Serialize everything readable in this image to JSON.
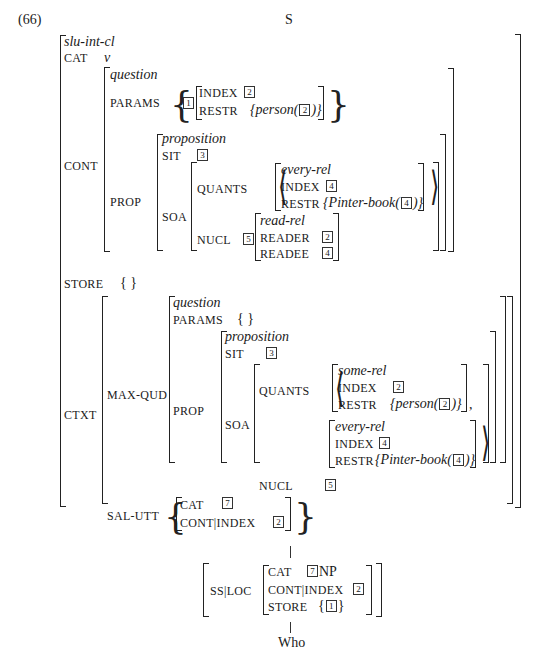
{
  "example_number": "(66)",
  "root_label": "S",
  "avm": {
    "type": "slu-int-cl",
    "cat_attr": "CAT",
    "cat_val": "v",
    "cont_attr": "CONT",
    "cont": {
      "type": "question",
      "params_attr": "PARAMS",
      "params_tag": "1",
      "params_index_attr": "INDEX",
      "params_index_tag": "2",
      "params_restr_attr": "RESTR",
      "params_restr_val": "person(",
      "params_restr_tag": "2",
      "prop_attr": "PROP",
      "prop": {
        "type": "proposition",
        "sit_attr": "SIT",
        "sit_tag": "3",
        "soa_attr": "SOA",
        "quants_attr": "QUANTS",
        "quant": {
          "type": "every-rel",
          "index_attr": "INDEX",
          "index_tag": "4",
          "restr_attr": "RESTR",
          "restr_val": "Pinter-book(",
          "restr_tag": "4"
        },
        "nucl_attr": "NUCL",
        "nucl_tag": "5",
        "nucl": {
          "type": "read-rel",
          "reader_attr": "READER",
          "reader_tag": "2",
          "readee_attr": "READEE",
          "readee_tag": "4"
        }
      }
    },
    "store_attr": "STORE",
    "store_val": "{ }",
    "ctxt_attr": "CTXT",
    "ctxt": {
      "maxqud_attr": "MAX-QUD",
      "maxqud": {
        "type": "question",
        "params_attr": "PARAMS",
        "params_val": "{ }",
        "prop_attr": "PROP",
        "prop": {
          "type": "proposition",
          "sit_attr": "SIT",
          "sit_tag": "3",
          "soa_attr": "SOA",
          "quants_attr": "QUANTS",
          "quant1": {
            "type": "some-rel",
            "index_attr": "INDEX",
            "index_tag": "2",
            "restr_attr": "RESTR",
            "restr_val": "person(",
            "restr_tag": "2"
          },
          "quant2": {
            "type": "every-rel",
            "index_attr": "INDEX",
            "index_tag": "4",
            "restr_attr": "RESTR",
            "restr_val": "Pinter-book(",
            "restr_tag": "4"
          },
          "nucl_attr": "NUCL",
          "nucl_tag": "5"
        }
      },
      "salutt_attr": "SAL-UTT",
      "salutt": {
        "cat_attr": "CAT",
        "cat_tag": "7",
        "cont_attr": "CONT|INDEX",
        "cont_tag": "2"
      }
    }
  },
  "daughter": {
    "ssloc_attr": "SS|LOC",
    "cat_attr": "CAT",
    "cat_tag": "7",
    "cat_val": "NP",
    "cont_attr": "CONT|INDEX",
    "cont_tag": "2",
    "store_attr": "STORE",
    "store_tag": "1",
    "word": "Who"
  }
}
